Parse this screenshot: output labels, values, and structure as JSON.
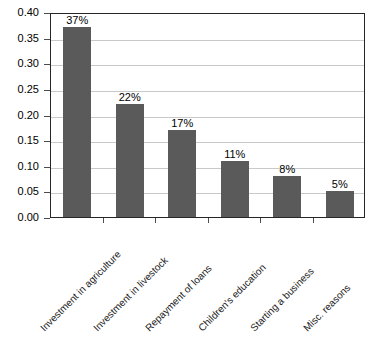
{
  "chart_data": {
    "type": "bar",
    "title": "",
    "subtitle": "",
    "xlabel": "",
    "ylabel": "",
    "categories": [
      "Investment in agriculture",
      "Investment in livestock",
      "Repayment of loans",
      "Children's education",
      "Starting a business",
      "Misc. reasons"
    ],
    "values": [
      0.37,
      0.22,
      0.17,
      0.11,
      0.08,
      0.05
    ],
    "data_labels": [
      "37%",
      "22%",
      "17%",
      "11%",
      "8%",
      "5%"
    ],
    "ylim": [
      0.0,
      0.4
    ],
    "ytick_labels": [
      "0.40",
      "0.35",
      "0.30",
      "0.25",
      "0.20",
      "0.15",
      "0.10",
      "0.05",
      "0.00"
    ],
    "ytick_values": [
      0.4,
      0.35,
      0.3,
      0.25,
      0.2,
      0.15,
      0.1,
      0.05,
      0.0
    ],
    "grid": "horizontal",
    "legend": "none",
    "bar_color": "#5a5a5a",
    "gridline_color": "#c9c9c9",
    "axis_color": "#262626",
    "plot_background": "#ffffff",
    "x_label_rotation": "-45"
  }
}
